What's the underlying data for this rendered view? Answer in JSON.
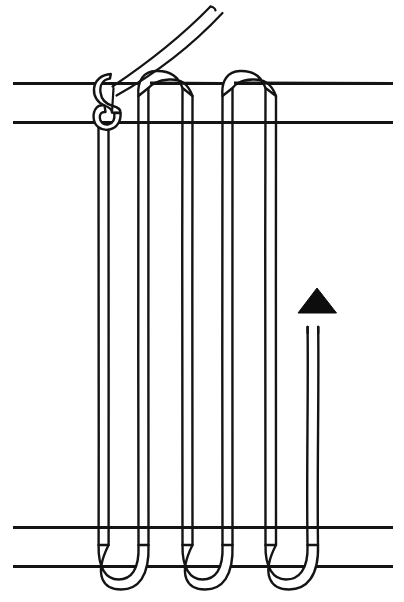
{
  "figure": {
    "title": "Knotted cord lacing diagram",
    "background_color": "#ffffff",
    "ink_color": "#141414",
    "arrow_color": "#0d0d0d",
    "canvas": {
      "width": 404,
      "height": 602
    }
  },
  "rails": {
    "label": "horizontal rails",
    "count": 4,
    "x_start": 13,
    "x_end": 393,
    "items": [
      {
        "name": "top-rail-upper",
        "y": 83
      },
      {
        "name": "top-rail-lower",
        "y": 122
      },
      {
        "name": "bottom-rail-upper",
        "y": 527
      },
      {
        "name": "bottom-rail-lower",
        "y": 566
      }
    ]
  },
  "knot": {
    "label": "figure-eight knot",
    "center_x": 111,
    "top_y": 78,
    "bottom_y": 131
  },
  "tail": {
    "label": "free working tail",
    "from_x": 113,
    "from_y": 86,
    "to_x": 222,
    "to_y": 8
  },
  "cords": {
    "label": "laced cord strands",
    "pairs": [
      {
        "name": "strand-1",
        "left_x": 98,
        "right_x": 108
      },
      {
        "name": "strand-2",
        "left_x": 138,
        "right_x": 148
      },
      {
        "name": "strand-3",
        "left_x": 182,
        "right_x": 192
      },
      {
        "name": "strand-4",
        "left_x": 222,
        "right_x": 232
      },
      {
        "name": "strand-5",
        "left_x": 265,
        "right_x": 276
      },
      {
        "name": "strand-6",
        "left_x": 307,
        "right_x": 318
      }
    ],
    "top_arches": [
      {
        "name": "top-arch-1",
        "apex_y": 73,
        "left_x": 148,
        "right_x": 182
      },
      {
        "name": "top-arch-2",
        "apex_y": 73,
        "left_x": 232,
        "right_x": 265
      }
    ],
    "bottom_bends": [
      {
        "name": "bottom-bend-1",
        "nadir_y": 578,
        "left_x": 108,
        "right_x": 138
      },
      {
        "name": "bottom-bend-2",
        "nadir_y": 578,
        "left_x": 192,
        "right_x": 222
      },
      {
        "name": "bottom-bend-3",
        "nadir_y": 578,
        "left_x": 276,
        "right_x": 307
      }
    ]
  },
  "arrow": {
    "label": "direction-of-pull arrow",
    "tip_x": 317,
    "tip_y": 288,
    "base_y": 313,
    "half_width": 19,
    "shaft_top_y": 326,
    "shaft_bottom_y": 527
  }
}
